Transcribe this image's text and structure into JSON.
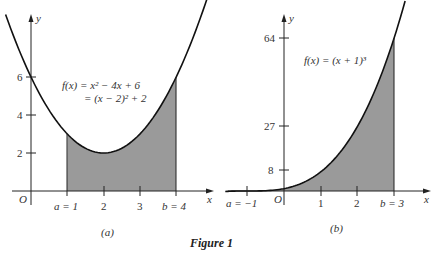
{
  "figure": {
    "caption": "Figure 1"
  },
  "chart_data": [
    {
      "type": "area",
      "panel_label": "(a)",
      "function_label_line1": "f(x) = x² − 4x + 6",
      "function_label_line2": "= (x − 2)² + 2",
      "xlabel": "x",
      "ylabel": "y",
      "origin_label": "O",
      "x_ticks": [
        "a = 1",
        "2",
        "3",
        "b = 4"
      ],
      "y_ticks": [
        "2",
        "4",
        "6"
      ],
      "shaded_interval": [
        1,
        4
      ],
      "x": [
        1,
        2,
        3,
        4
      ],
      "values": [
        3,
        2,
        3,
        6
      ],
      "xlim": [
        -0.7,
        5.5
      ],
      "ylim": [
        0,
        8
      ]
    },
    {
      "type": "area",
      "panel_label": "(b)",
      "function_label": "f(x) = (x + 1)³",
      "xlabel": "x",
      "ylabel": "y",
      "origin_label": "O",
      "x_ticks": [
        "a = −1",
        "1",
        "2",
        "b = 3"
      ],
      "y_ticks": [
        "8",
        "27",
        "64"
      ],
      "shaded_interval": [
        -1,
        3
      ],
      "x": [
        -1,
        0,
        1,
        2,
        3
      ],
      "values": [
        0,
        1,
        8,
        27,
        64
      ],
      "xlim": [
        -1.7,
        4.0
      ],
      "ylim": [
        0,
        75
      ]
    }
  ]
}
